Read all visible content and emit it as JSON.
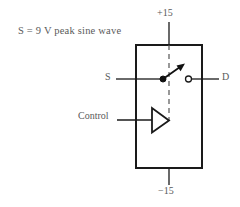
{
  "figure": {
    "note": "S = 9 V peak sine wave",
    "background_color": "#ffffff",
    "line_color": "#1a1a1a",
    "text_color": "#5a5a5a"
  },
  "labels": {
    "supply_positive": "+15",
    "supply_negative": "−15",
    "source_terminal": "S",
    "drain_terminal": "D",
    "control_terminal": "Control"
  },
  "symbols": {
    "switch_pole": "filled-dot",
    "switch_throw": "open-circle",
    "switch_arm": "arrow-open",
    "control_buffer": "triangle-buffer",
    "internal_connection": "dashed-line",
    "package": "rectangle"
  },
  "geometry": {
    "box": {
      "x": 136,
      "y": 45,
      "width": 66,
      "height": 123
    },
    "dashed_line_x": 169,
    "signal_line_y": 79,
    "control_line_y": 120
  }
}
